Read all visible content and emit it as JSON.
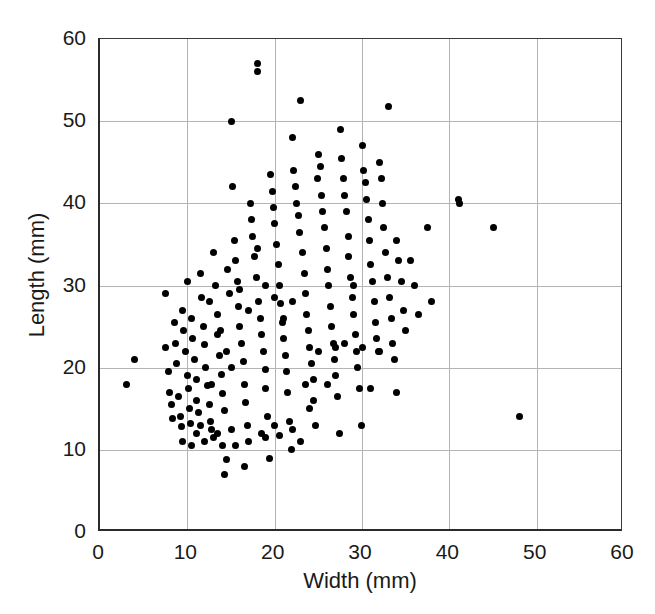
{
  "chart_data": {
    "type": "scatter",
    "title": "",
    "subtitle": "",
    "xlabel": "Width (mm)",
    "ylabel": "Length (mm)",
    "xlim": [
      0,
      60
    ],
    "ylim": [
      0,
      60
    ],
    "xticks": [
      0,
      10,
      20,
      30,
      40,
      50,
      60
    ],
    "yticks": [
      0,
      10,
      20,
      30,
      40,
      50,
      60
    ],
    "xtick_labels": [
      "0",
      "10",
      "20",
      "30",
      "40",
      "50",
      "60"
    ],
    "ytick_labels": [
      "0",
      "10",
      "20",
      "30",
      "40",
      "50",
      "60"
    ],
    "grid": true,
    "grid_color": "#b4b4b4",
    "legend": null,
    "marker": {
      "shape": "circle",
      "color": "#000000",
      "size_px": 7
    },
    "axis_color": "#2b2b2b",
    "note": "x-axis right-most tick label '60' is clipped at the image edge",
    "series": [
      {
        "name": "specimens",
        "points": [
          [
            3.0,
            18.0
          ],
          [
            4.0,
            21.0
          ],
          [
            7.5,
            29.0
          ],
          [
            7.5,
            22.5
          ],
          [
            7.8,
            19.5
          ],
          [
            8.0,
            17.0
          ],
          [
            8.2,
            15.5
          ],
          [
            8.3,
            13.8
          ],
          [
            8.5,
            25.5
          ],
          [
            8.6,
            23.0
          ],
          [
            8.8,
            20.5
          ],
          [
            9.0,
            16.5
          ],
          [
            9.2,
            14.0
          ],
          [
            9.3,
            12.8
          ],
          [
            9.5,
            27.0
          ],
          [
            9.6,
            24.5
          ],
          [
            9.8,
            22.0
          ],
          [
            10.0,
            19.0
          ],
          [
            10.1,
            17.5
          ],
          [
            10.2,
            15.0
          ],
          [
            10.4,
            13.2
          ],
          [
            10.5,
            26.0
          ],
          [
            10.6,
            23.5
          ],
          [
            10.8,
            21.0
          ],
          [
            11.0,
            18.5
          ],
          [
            11.1,
            16.0
          ],
          [
            11.3,
            14.5
          ],
          [
            11.5,
            13.0
          ],
          [
            11.6,
            28.5
          ],
          [
            11.8,
            25.0
          ],
          [
            12.0,
            22.8
          ],
          [
            12.1,
            20.0
          ],
          [
            12.3,
            17.8
          ],
          [
            12.5,
            15.5
          ],
          [
            12.6,
            13.5
          ],
          [
            12.8,
            12.5
          ],
          [
            13.0,
            34.0
          ],
          [
            13.2,
            30.0
          ],
          [
            13.4,
            26.5
          ],
          [
            13.5,
            24.0
          ],
          [
            13.7,
            21.5
          ],
          [
            13.9,
            19.2
          ],
          [
            14.0,
            16.8
          ],
          [
            14.2,
            14.8
          ],
          [
            14.3,
            7.0
          ],
          [
            14.5,
            8.8
          ],
          [
            14.6,
            32.0
          ],
          [
            14.8,
            29.0
          ],
          [
            15.0,
            50.0
          ],
          [
            15.2,
            42.0
          ],
          [
            15.4,
            35.5
          ],
          [
            15.5,
            33.0
          ],
          [
            15.7,
            30.5
          ],
          [
            15.9,
            27.5
          ],
          [
            16.0,
            25.0
          ],
          [
            16.2,
            23.0
          ],
          [
            16.4,
            20.8
          ],
          [
            16.5,
            18.0
          ],
          [
            16.7,
            15.8
          ],
          [
            16.9,
            13.0
          ],
          [
            17.0,
            11.0
          ],
          [
            17.2,
            40.0
          ],
          [
            17.4,
            38.0
          ],
          [
            17.5,
            36.0
          ],
          [
            17.7,
            33.5
          ],
          [
            17.9,
            31.0
          ],
          [
            18.0,
            57.0
          ],
          [
            18.0,
            56.0
          ],
          [
            18.2,
            28.0
          ],
          [
            18.4,
            26.0
          ],
          [
            18.5,
            24.0
          ],
          [
            18.7,
            22.0
          ],
          [
            18.9,
            19.8
          ],
          [
            19.0,
            17.5
          ],
          [
            19.2,
            14.0
          ],
          [
            19.4,
            9.0
          ],
          [
            19.5,
            43.5
          ],
          [
            19.7,
            41.5
          ],
          [
            19.9,
            39.5
          ],
          [
            20.0,
            37.5
          ],
          [
            20.2,
            35.0
          ],
          [
            20.4,
            32.5
          ],
          [
            20.5,
            30.0
          ],
          [
            20.7,
            27.8
          ],
          [
            20.9,
            25.5
          ],
          [
            21.0,
            23.5
          ],
          [
            21.2,
            21.5
          ],
          [
            21.4,
            19.5
          ],
          [
            21.5,
            17.0
          ],
          [
            21.7,
            13.5
          ],
          [
            21.9,
            10.0
          ],
          [
            22.0,
            48.0
          ],
          [
            22.2,
            44.0
          ],
          [
            22.4,
            42.0
          ],
          [
            22.5,
            40.0
          ],
          [
            22.7,
            38.5
          ],
          [
            22.9,
            36.5
          ],
          [
            23.0,
            52.5
          ],
          [
            23.2,
            34.0
          ],
          [
            23.4,
            31.5
          ],
          [
            23.5,
            29.0
          ],
          [
            23.7,
            26.5
          ],
          [
            23.9,
            24.5
          ],
          [
            24.0,
            22.5
          ],
          [
            24.2,
            20.5
          ],
          [
            24.4,
            18.5
          ],
          [
            24.5,
            16.0
          ],
          [
            24.7,
            13.0
          ],
          [
            24.9,
            43.0
          ],
          [
            25.0,
            46.0
          ],
          [
            25.2,
            44.5
          ],
          [
            25.4,
            41.0
          ],
          [
            25.5,
            39.0
          ],
          [
            25.7,
            37.0
          ],
          [
            25.9,
            34.5
          ],
          [
            26.0,
            32.0
          ],
          [
            26.2,
            30.0
          ],
          [
            26.4,
            27.5
          ],
          [
            26.5,
            25.0
          ],
          [
            26.7,
            23.0
          ],
          [
            26.9,
            21.0
          ],
          [
            27.0,
            19.0
          ],
          [
            27.2,
            16.5
          ],
          [
            27.4,
            12.0
          ],
          [
            27.5,
            49.0
          ],
          [
            27.7,
            45.5
          ],
          [
            27.9,
            43.0
          ],
          [
            28.0,
            41.0
          ],
          [
            28.2,
            39.0
          ],
          [
            28.4,
            36.0
          ],
          [
            28.5,
            33.5
          ],
          [
            28.7,
            31.0
          ],
          [
            28.9,
            28.5
          ],
          [
            29.0,
            26.5
          ],
          [
            29.2,
            24.0
          ],
          [
            29.4,
            22.0
          ],
          [
            29.5,
            20.0
          ],
          [
            29.7,
            17.5
          ],
          [
            29.9,
            13.0
          ],
          [
            30.0,
            47.0
          ],
          [
            30.2,
            44.0
          ],
          [
            30.4,
            42.5
          ],
          [
            30.5,
            40.5
          ],
          [
            30.7,
            38.0
          ],
          [
            30.9,
            35.5
          ],
          [
            31.0,
            32.5
          ],
          [
            31.2,
            30.5
          ],
          [
            31.4,
            28.0
          ],
          [
            31.5,
            25.5
          ],
          [
            31.7,
            23.5
          ],
          [
            31.9,
            22.0
          ],
          [
            32.0,
            45.0
          ],
          [
            32.2,
            43.0
          ],
          [
            32.4,
            40.0
          ],
          [
            32.5,
            37.0
          ],
          [
            32.7,
            34.0
          ],
          [
            32.9,
            31.0
          ],
          [
            33.0,
            51.8
          ],
          [
            33.2,
            28.5
          ],
          [
            33.4,
            26.0
          ],
          [
            33.5,
            23.0
          ],
          [
            33.7,
            21.0
          ],
          [
            33.9,
            17.0
          ],
          [
            34.0,
            35.5
          ],
          [
            34.2,
            33.0
          ],
          [
            34.5,
            30.5
          ],
          [
            34.8,
            27.0
          ],
          [
            35.0,
            24.5
          ],
          [
            35.5,
            33.0
          ],
          [
            36.0,
            30.0
          ],
          [
            36.5,
            26.5
          ],
          [
            37.5,
            37.0
          ],
          [
            38.0,
            28.0
          ],
          [
            41.0,
            40.5
          ],
          [
            41.2,
            40.0
          ],
          [
            45.0,
            37.0
          ],
          [
            48.0,
            14.0
          ],
          [
            10.0,
            30.5
          ],
          [
            11.5,
            31.5
          ],
          [
            12.5,
            28.0
          ],
          [
            13.0,
            11.5
          ],
          [
            13.5,
            12.0
          ],
          [
            15.0,
            12.5
          ],
          [
            15.5,
            10.5
          ],
          [
            16.5,
            8.0
          ],
          [
            18.5,
            12.0
          ],
          [
            19.0,
            11.5
          ],
          [
            20.0,
            13.0
          ],
          [
            20.5,
            11.8
          ],
          [
            22.0,
            12.5
          ],
          [
            23.0,
            11.0
          ],
          [
            9.5,
            11.0
          ],
          [
            10.5,
            10.5
          ],
          [
            11.0,
            12.0
          ],
          [
            12.0,
            11.0
          ],
          [
            14.0,
            10.5
          ],
          [
            12.8,
            18.0
          ],
          [
            13.8,
            24.5
          ],
          [
            14.5,
            22.0
          ],
          [
            15.0,
            20.0
          ],
          [
            16.0,
            29.5
          ],
          [
            17.0,
            27.0
          ],
          [
            18.0,
            34.5
          ],
          [
            19.0,
            30.0
          ],
          [
            20.0,
            28.5
          ],
          [
            21.0,
            26.0
          ],
          [
            22.0,
            28.0
          ],
          [
            23.5,
            18.0
          ],
          [
            24.0,
            15.0
          ],
          [
            25.0,
            22.0
          ],
          [
            26.0,
            18.0
          ],
          [
            27.0,
            22.5
          ],
          [
            28.0,
            23.0
          ],
          [
            29.0,
            30.0
          ],
          [
            30.0,
            22.5
          ],
          [
            31.0,
            17.5
          ],
          [
            32.0,
            22.0
          ]
        ]
      }
    ]
  },
  "axes": {
    "x": {
      "label": "Width (mm)",
      "ticks": [
        "0",
        "10",
        "20",
        "30",
        "40",
        "50",
        "60"
      ]
    },
    "y": {
      "label": "Length (mm)",
      "ticks": [
        "0",
        "10",
        "20",
        "30",
        "40",
        "50",
        "60"
      ]
    }
  }
}
